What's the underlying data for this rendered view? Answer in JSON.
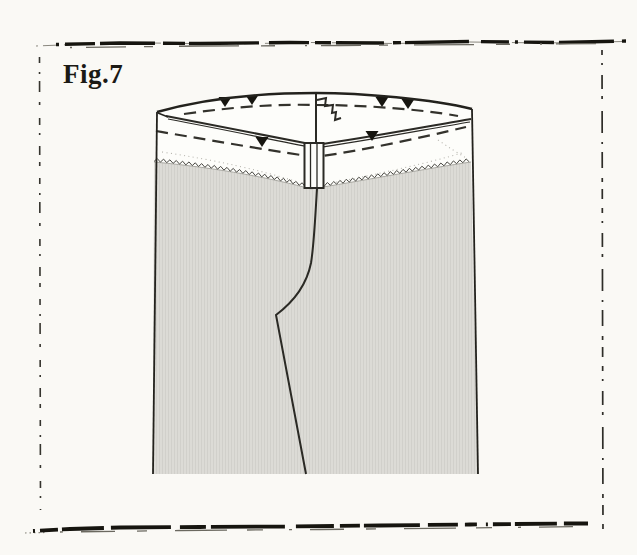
{
  "page": {
    "figure_label": "Fig.7",
    "background_color": "#faf9f5"
  },
  "illustration": {
    "subject": "trousers-waistband-facing-sewing-step",
    "colors": {
      "outline": "#2b2a25",
      "fabric_gray": "#dcdbd6",
      "band_white": "#fdfdfa",
      "notch_black": "#16150f",
      "scan_ink": "#16150f"
    },
    "marks": {
      "back_stitchline_notches": 4,
      "front_stitchline_notches": 2,
      "stitch_line_style": "dashed",
      "facing_edge_finish": "zigzag-overcast",
      "center_front_mark": "zipper-zigzag"
    }
  }
}
